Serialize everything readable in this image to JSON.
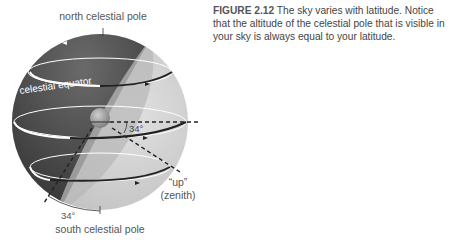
{
  "figure": {
    "number": "FIGURE 2.12",
    "caption": "The sky varies with latitude. Notice that the altitude of the celestial pole that is visible in your sky is always equal to your latitude."
  },
  "labels": {
    "north_pole": "north celestial pole",
    "south_pole": "south celestial pole",
    "equator": "celestial equator",
    "angle_top": "34°",
    "angle_bottom": "34°",
    "up": "“up”",
    "zenith": "(zenith)"
  },
  "colors": {
    "sphere_dark": "#3a3a3a",
    "sphere_light": "#d4d4d4",
    "horizon_plane": "#bcbcbc",
    "text": "#555555"
  }
}
